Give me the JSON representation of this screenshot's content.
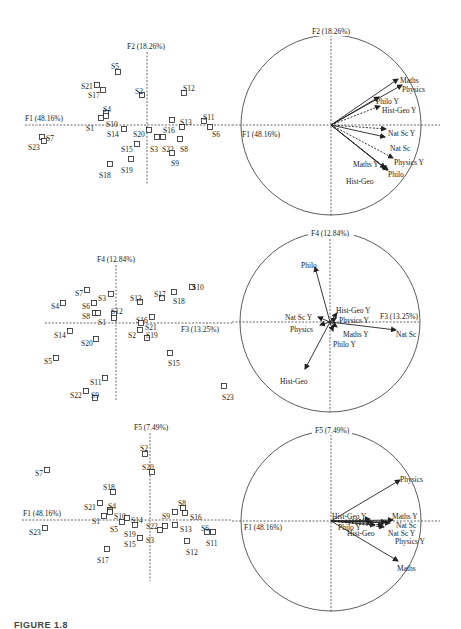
{
  "caption": "FIGURE 1.8",
  "chart_data": [
    {
      "type": "scatter",
      "title": "Individuals on F1 x F2",
      "xlabel": "F1 (48.16%)",
      "ylabel": "F2 (18.26%)",
      "grid": false,
      "panel": {
        "x0": 25,
        "x1": 232,
        "axis_y": 125,
        "axis_x": 147,
        "y0": 45,
        "y1": 185
      },
      "points": [
        {
          "label": "S5",
          "px": 118,
          "py": 72,
          "lx": 111,
          "ly": 66
        },
        {
          "label": "S21",
          "px": 97,
          "py": 85,
          "lx": 81,
          "ly": 86
        },
        {
          "label": "S17",
          "px": 103,
          "py": 90,
          "lx": 88,
          "ly": 95
        },
        {
          "label": "S2",
          "px": 142,
          "py": 95,
          "lx": 135,
          "ly": 91
        },
        {
          "label": "S12",
          "px": 184,
          "py": 93,
          "lx": 183,
          "ly": 88
        },
        {
          "label": "S4",
          "px": 106,
          "py": 113,
          "lx": 103,
          "ly": 109
        },
        {
          "label": "S10",
          "px": 106,
          "py": 116,
          "lx": 106,
          "ly": 124
        },
        {
          "label": "S1",
          "px": 101,
          "py": 118,
          "lx": 86,
          "ly": 128
        },
        {
          "label": "S14",
          "px": 124,
          "py": 129,
          "lx": 107,
          "ly": 134
        },
        {
          "label": "S20",
          "px": 149,
          "py": 130,
          "lx": 133,
          "ly": 134
        },
        {
          "label": "S16",
          "px": 172,
          "py": 120,
          "lx": 163,
          "ly": 130
        },
        {
          "label": "S13",
          "px": 182,
          "py": 127,
          "lx": 180,
          "ly": 122
        },
        {
          "label": "S11",
          "px": 204,
          "py": 121,
          "lx": 203,
          "ly": 117
        },
        {
          "label": "S6",
          "px": 210,
          "py": 127,
          "lx": 212,
          "ly": 134
        },
        {
          "label": "S3",
          "px": 157,
          "py": 137,
          "lx": 150,
          "ly": 149
        },
        {
          "label": "S22",
          "px": 163,
          "py": 137,
          "lx": 162,
          "ly": 149
        },
        {
          "label": "S8",
          "px": 180,
          "py": 139,
          "lx": 180,
          "ly": 149
        },
        {
          "label": "S9",
          "px": 172,
          "py": 153,
          "lx": 171,
          "ly": 163
        },
        {
          "label": "S15",
          "px": 137,
          "py": 144,
          "lx": 121,
          "ly": 149
        },
        {
          "label": "S19",
          "px": 131,
          "py": 159,
          "lx": 121,
          "ly": 170
        },
        {
          "label": "S18",
          "px": 110,
          "py": 164,
          "lx": 99,
          "ly": 175
        },
        {
          "label": "S7",
          "px": 42,
          "py": 137,
          "lx": 46,
          "ly": 138
        },
        {
          "label": "S23",
          "px": 44,
          "py": 141,
          "lx": 28,
          "ly": 147
        }
      ]
    },
    {
      "type": "correlation-circle",
      "title": "Variables on F1 x F2",
      "xlabel": "F1 (48.16%)",
      "ylabel": "F2 (18.26%)",
      "circle": {
        "cx": 331,
        "cy": 125,
        "r": 90
      },
      "vectors": [
        {
          "label": "Maths",
          "x": 398,
          "y": 79,
          "dashed": false,
          "lx": 400,
          "ly": 80
        },
        {
          "label": "Physics",
          "x": 402,
          "y": 85,
          "dashed": false,
          "lx": 402,
          "ly": 89
        },
        {
          "label": "Philo Y",
          "x": 379,
          "y": 97,
          "dashed": false,
          "lx": 376,
          "ly": 101
        },
        {
          "label": "Hist-Geo Y",
          "x": 380,
          "y": 106,
          "dashed": true,
          "lx": 382,
          "ly": 110
        },
        {
          "label": "Nat Sc Y",
          "x": 386,
          "y": 129,
          "dashed": true,
          "lx": 388,
          "ly": 133
        },
        {
          "label": "Nat Sc",
          "x": 385,
          "y": 137,
          "dashed": false,
          "lx": 390,
          "ly": 148
        },
        {
          "label": "Physics Y",
          "x": 393,
          "y": 158,
          "dashed": true,
          "lx": 394,
          "ly": 162
        },
        {
          "label": "Maths Y",
          "x": 388,
          "y": 170,
          "dashed": true,
          "lx": 353,
          "ly": 164
        },
        {
          "label": "Philo",
          "x": 387,
          "y": 170,
          "dashed": false,
          "lx": 388,
          "ly": 174
        },
        {
          "label": "Hist-Geo",
          "x": 385,
          "y": 168,
          "dashed": false,
          "lx": 346,
          "ly": 181
        }
      ]
    },
    {
      "type": "scatter",
      "title": "Individuals on F3 x F4",
      "xlabel": "F3 (13.25%)",
      "ylabel": "F4 (12.84%)",
      "grid": false,
      "panel": {
        "x0": 45,
        "x1": 232,
        "axis_y": 323,
        "axis_x": 116,
        "y0": 264,
        "y1": 400
      },
      "points": [
        {
          "label": "S10",
          "px": 192,
          "py": 287,
          "lx": 192,
          "ly": 287
        },
        {
          "label": "S17",
          "px": 162,
          "py": 298,
          "lx": 154,
          "ly": 294
        },
        {
          "label": "S18",
          "px": 174,
          "py": 292,
          "lx": 173,
          "ly": 301
        },
        {
          "label": "S7",
          "px": 87,
          "py": 290,
          "lx": 75,
          "ly": 293
        },
        {
          "label": "S3",
          "px": 111,
          "py": 294,
          "lx": 98,
          "ly": 298
        },
        {
          "label": "S13",
          "px": 140,
          "py": 302,
          "lx": 130,
          "ly": 298
        },
        {
          "label": "S4",
          "px": 63,
          "py": 303,
          "lx": 51,
          "ly": 306
        },
        {
          "label": "S6",
          "px": 94,
          "py": 303,
          "lx": 82,
          "ly": 306
        },
        {
          "label": "S8",
          "px": 95,
          "py": 313,
          "lx": 82,
          "ly": 316
        },
        {
          "label": "S8b",
          "px": 98,
          "py": 313,
          "lx": 0,
          "ly": 0,
          "hidden_label": true
        },
        {
          "label": "S12",
          "px": 114,
          "py": 314,
          "lx": 111,
          "ly": 311
        },
        {
          "label": "S1",
          "px": 114,
          "py": 318,
          "lx": 98,
          "ly": 322
        },
        {
          "label": "S16",
          "px": 152,
          "py": 317,
          "lx": 136,
          "ly": 320
        },
        {
          "label": "S21",
          "px": 141,
          "py": 323,
          "lx": 145,
          "ly": 327
        },
        {
          "label": "S14",
          "px": 70,
          "py": 331,
          "lx": 54,
          "ly": 335
        },
        {
          "label": "S2",
          "px": 140,
          "py": 330,
          "lx": 128,
          "ly": 335
        },
        {
          "label": "S19",
          "px": 147,
          "py": 338,
          "lx": 146,
          "ly": 335
        },
        {
          "label": "S20",
          "px": 96,
          "py": 339,
          "lx": 81,
          "ly": 343
        },
        {
          "label": "S5",
          "px": 56,
          "py": 358,
          "lx": 44,
          "ly": 361
        },
        {
          "label": "S15",
          "px": 170,
          "py": 353,
          "lx": 168,
          "ly": 363
        },
        {
          "label": "S11",
          "px": 105,
          "py": 378,
          "lx": 90,
          "ly": 382
        },
        {
          "label": "S22",
          "px": 86,
          "py": 391,
          "lx": 70,
          "ly": 395
        },
        {
          "label": "S9",
          "px": 95,
          "py": 398,
          "lx": 91,
          "ly": 395
        },
        {
          "label": "S23",
          "px": 224,
          "py": 386,
          "lx": 222,
          "ly": 397
        }
      ]
    },
    {
      "type": "correlation-circle",
      "title": "Variables on F3 x F4",
      "xlabel": "F3 (13.25%)",
      "ylabel": "F4 (12.84%)",
      "circle": {
        "cx": 330,
        "cy": 322,
        "r": 90
      },
      "vectors": [
        {
          "label": "Philo",
          "x": 315,
          "y": 267,
          "dashed": false,
          "lx": 301,
          "ly": 265
        },
        {
          "label": "Hist-Geo",
          "x": 305,
          "y": 369,
          "dashed": false,
          "lx": 280,
          "ly": 381
        },
        {
          "label": "Nat Sc",
          "x": 396,
          "y": 330,
          "dashed": false,
          "lx": 396,
          "ly": 334
        },
        {
          "label": "Nat Sc Y",
          "x": 318,
          "y": 317,
          "dashed": false,
          "lx": 285,
          "ly": 317
        },
        {
          "label": "Physics",
          "x": 320,
          "y": 325,
          "dashed": false,
          "lx": 290,
          "ly": 329
        },
        {
          "label": "Hist-Geo Y",
          "x": 337,
          "y": 313,
          "dashed": false,
          "lx": 336,
          "ly": 310
        },
        {
          "label": "Physics Y",
          "x": 336,
          "y": 318,
          "dashed": false,
          "lx": 339,
          "ly": 320
        },
        {
          "label": "Maths Y",
          "x": 337,
          "y": 327,
          "dashed": false,
          "lx": 343,
          "ly": 334
        },
        {
          "label": "Philo Y",
          "x": 333,
          "y": 331,
          "dashed": false,
          "lx": 333,
          "ly": 344
        }
      ],
      "axis_label_x_pos": {
        "x": 380,
        "y": 319
      }
    },
    {
      "type": "scatter",
      "title": "Individuals on F1 x F5",
      "xlabel": "F1 (48.16%)",
      "ylabel": "F5 (7.49%)",
      "grid": false,
      "panel": {
        "x0": 22,
        "x1": 232,
        "axis_y": 520,
        "axis_x": 150,
        "y0": 440,
        "y1": 580
      },
      "points": [
        {
          "label": "S2",
          "px": 145,
          "py": 454,
          "lx": 140,
          "ly": 448
        },
        {
          "label": "S20",
          "px": 152,
          "py": 472,
          "lx": 142,
          "ly": 467
        },
        {
          "label": "S7",
          "px": 47,
          "py": 470,
          "lx": 35,
          "ly": 473
        },
        {
          "label": "S18",
          "px": 113,
          "py": 492,
          "lx": 103,
          "ly": 487
        },
        {
          "label": "S21",
          "px": 100,
          "py": 503,
          "lx": 84,
          "ly": 507
        },
        {
          "label": "S4",
          "px": 110,
          "py": 510,
          "lx": 108,
          "ly": 506
        },
        {
          "label": "S10",
          "px": 110,
          "py": 512,
          "lx": 114,
          "ly": 516
        },
        {
          "label": "S1",
          "px": 104,
          "py": 516,
          "lx": 92,
          "ly": 521
        },
        {
          "label": "S14",
          "px": 127,
          "py": 518,
          "lx": 131,
          "ly": 520
        },
        {
          "label": "S5",
          "px": 122,
          "py": 522,
          "lx": 110,
          "ly": 529
        },
        {
          "label": "S19",
          "px": 135,
          "py": 525,
          "lx": 124,
          "ly": 534
        },
        {
          "label": "S22",
          "px": 165,
          "py": 526,
          "lx": 146,
          "ly": 526
        },
        {
          "label": "S3",
          "px": 160,
          "py": 530,
          "lx": 146,
          "ly": 540
        },
        {
          "label": "S15",
          "px": 140,
          "py": 538,
          "lx": 124,
          "ly": 544
        },
        {
          "label": "S9",
          "px": 175,
          "py": 512,
          "lx": 162,
          "ly": 516
        },
        {
          "label": "S8",
          "px": 183,
          "py": 508,
          "lx": 178,
          "ly": 503
        },
        {
          "label": "S16",
          "px": 185,
          "py": 513,
          "lx": 190,
          "ly": 517
        },
        {
          "label": "S13",
          "px": 175,
          "py": 525,
          "lx": 180,
          "ly": 529
        },
        {
          "label": "S6",
          "px": 207,
          "py": 532,
          "lx": 201,
          "ly": 528
        },
        {
          "label": "S11",
          "px": 213,
          "py": 532,
          "lx": 206,
          "ly": 543
        },
        {
          "label": "S12",
          "px": 187,
          "py": 541,
          "lx": 186,
          "ly": 552
        },
        {
          "label": "S17",
          "px": 107,
          "py": 549,
          "lx": 97,
          "ly": 560
        },
        {
          "label": "S23",
          "px": 45,
          "py": 528,
          "lx": 29,
          "ly": 532
        }
      ]
    },
    {
      "type": "correlation-circle",
      "title": "Variables on F1 x F5",
      "xlabel": "F1 (48.16%)",
      "ylabel": "F5 (7.49%)",
      "circle": {
        "cx": 331,
        "cy": 521,
        "r": 90
      },
      "vectors": [
        {
          "label": "Physics",
          "x": 400,
          "y": 480,
          "dashed": false,
          "lx": 400,
          "ly": 479
        },
        {
          "label": "Maths",
          "x": 398,
          "y": 561,
          "dashed": false,
          "lx": 397,
          "ly": 568
        },
        {
          "label": "Maths Y",
          "x": 393,
          "y": 520,
          "dashed": false,
          "lx": 392,
          "ly": 516
        },
        {
          "label": "Nat Sc",
          "x": 390,
          "y": 523,
          "dashed": false,
          "lx": 396,
          "ly": 525
        },
        {
          "label": "Nat Sc Y",
          "x": 384,
          "y": 527,
          "dashed": true,
          "lx": 388,
          "ly": 533
        },
        {
          "label": "Physics Y",
          "x": 383,
          "y": 525,
          "dashed": true,
          "lx": 395,
          "ly": 541
        },
        {
          "label": "Hist-Geo Y",
          "x": 370,
          "y": 519,
          "dashed": true,
          "lx": 332,
          "ly": 516
        },
        {
          "label": "Philo Y",
          "x": 372,
          "y": 522,
          "dashed": true,
          "lx": 338,
          "ly": 527
        },
        {
          "label": "Philo",
          "x": 386,
          "y": 522,
          "dashed": false,
          "lx": 0,
          "ly": 0,
          "hidden_label": true
        },
        {
          "label": "Hist-Geo",
          "x": 375,
          "y": 525,
          "dashed": false,
          "lx": 347,
          "ly": 533
        }
      ]
    }
  ],
  "labels": {
    "p1_x": "F1 (48.16%)",
    "p1_y": "F2 (18.26%)",
    "c1_x": "F1 (48.16%)",
    "c1_y": "F2 (18.26%)",
    "p2_x": "F3 (13.25%)",
    "p2_y": "F4 (12.84%)",
    "c2_x": "F3 (13.25%)",
    "c2_y": "F4 (12.84%)",
    "p3_x": "F1 (48.16%)",
    "p3_y": "F5 (7.49%)",
    "c3_x": "F1 (48.16%)",
    "c3_y": "F5 (7.49%)"
  }
}
